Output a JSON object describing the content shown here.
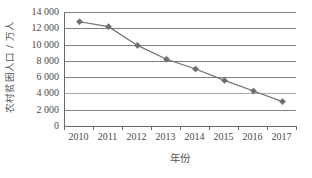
{
  "chart_data": {
    "type": "line",
    "title": "",
    "xlabel": "年份",
    "ylabel": "农村贫困人口 / 万人",
    "categories": [
      "2010",
      "2011",
      "2012",
      "2013",
      "2014",
      "2015",
      "2016",
      "2017"
    ],
    "values": [
      12800,
      12200,
      9900,
      8200,
      7000,
      5600,
      4300,
      3000
    ],
    "ylim": [
      0,
      14000
    ],
    "y_ticks": [
      0,
      2000,
      4000,
      6000,
      8000,
      10000,
      12000,
      14000
    ],
    "y_tick_labels": [
      "0",
      "2 000",
      "4 000",
      "6 000",
      "8 000",
      "10 000",
      "12 000",
      "14 000"
    ],
    "grid": true,
    "legend": "none",
    "series": [
      {
        "name": "农村贫困人口",
        "values": [
          12800,
          12200,
          9900,
          8200,
          7000,
          5600,
          4300,
          3000
        ],
        "marker": "diamond",
        "color": "#707070"
      }
    ]
  },
  "colors": {
    "line": "#707070",
    "marker": "#6e6e6e",
    "grid": "#808080",
    "grid_faint": "#a9a9a9",
    "axis": "#6b6b6b",
    "text": "#4a4a4a",
    "background": "#ffffff"
  }
}
